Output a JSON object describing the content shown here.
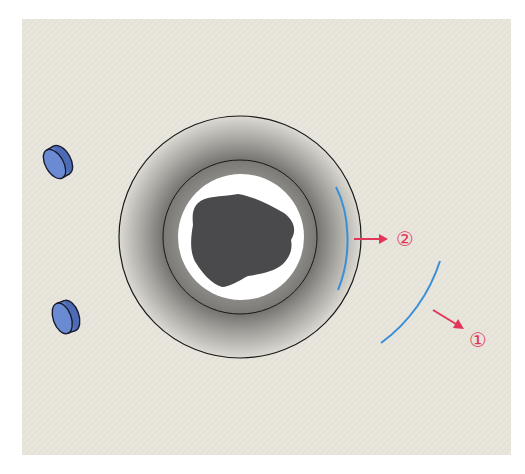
{
  "diagram": {
    "background_color": "#e8e5dc",
    "page_color": "#ffffff",
    "labels": {
      "label_1": "①",
      "label_2": "②"
    },
    "colors": {
      "arc_blue": "#3a8fd6",
      "arrow_red": "#e0365a",
      "label_red": "#e0365a",
      "outline": "#1a1a1a",
      "cell_dark": "#4a4a4c",
      "ring_white": "#ffffff",
      "disc_blue": "#5f7fc8"
    },
    "elements": [
      {
        "name": "outer-halo-circle",
        "cx": 240,
        "cy": 237,
        "r": 121
      },
      {
        "name": "inner-ring-circle",
        "cx": 240,
        "cy": 237,
        "r": 77
      },
      {
        "name": "white-zone-circle",
        "cx": 241,
        "cy": 237,
        "r": 63
      },
      {
        "name": "central-dark-body"
      },
      {
        "name": "inner-arc-blue",
        "label": "②"
      },
      {
        "name": "outer-arc-blue",
        "label": "①"
      },
      {
        "name": "disc-upper"
      },
      {
        "name": "disc-lower"
      }
    ]
  }
}
